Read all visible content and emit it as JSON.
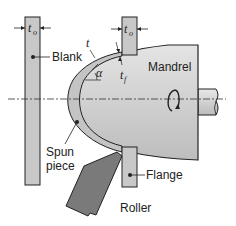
{
  "diagram": {
    "labels": {
      "blank": "Blank",
      "mandrel": "Mandrel",
      "spun_piece_line1": "Spun",
      "spun_piece_line2": "piece",
      "flange": "Flange",
      "roller": "Roller"
    },
    "symbols": {
      "t_left": "t",
      "t_left_sub": "o",
      "t_right": "t",
      "t_right_sub": "o",
      "t": "t",
      "t_f": "t",
      "t_f_sub": "f",
      "alpha": "α"
    },
    "icons": {
      "rotation": "rotation-arrow-icon"
    },
    "colors": {
      "part_fill": "#c8c8c8",
      "mandrel_fill": "#d4d4d4",
      "roller_fill": "#7a7a7a",
      "outline": "#222222",
      "background": "#ffffff"
    }
  }
}
